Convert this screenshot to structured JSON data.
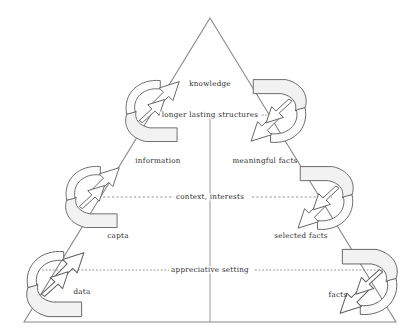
{
  "diagram": {
    "type": "hierarchy-triangle",
    "stroke_color": "#555555",
    "fill_color": "#f4f4f4",
    "text_color": "#2b2b2b",
    "apex": {
      "x": 210,
      "y": 18
    },
    "base_left": {
      "x": 24,
      "y": 322
    },
    "base_right": {
      "x": 396,
      "y": 322
    },
    "center_line_x": 210
  },
  "levels": [
    {
      "name": "knowledge",
      "label": "knowledge",
      "x": 210,
      "y": 84
    },
    {
      "name": "information",
      "label": "information",
      "x": 158,
      "y": 161
    },
    {
      "name": "meaningful-facts",
      "label": "meaningful facts",
      "x": 265,
      "y": 161
    },
    {
      "name": "capta",
      "label": "capta",
      "x": 118,
      "y": 236
    },
    {
      "name": "selected-facts",
      "label": "selected facts",
      "x": 301,
      "y": 236
    },
    {
      "name": "data",
      "label": "data",
      "x": 82,
      "y": 292
    },
    {
      "name": "facts",
      "label": "facts",
      "x": 338,
      "y": 295
    }
  ],
  "boundaries": [
    {
      "name": "longer-lasting-structures",
      "label": "longer lasting structures",
      "y": 115,
      "x": 210,
      "left_start": 158,
      "left_end": 176,
      "right_start": 262,
      "right_end": 281
    },
    {
      "name": "context-interests",
      "label": "context, interests",
      "y": 197,
      "x": 210,
      "left_start": 90,
      "left_end": 176,
      "right_start": 252,
      "right_end": 332
    },
    {
      "name": "appreciative-setting",
      "label": "appreciative setting",
      "y": 270,
      "x": 210,
      "left_start": 42,
      "left_end": 170,
      "right_start": 255,
      "right_end": 385
    }
  ],
  "arrows": [
    {
      "name": "arrow-left-lower",
      "side": "left",
      "direction": "up-right",
      "cx": 57,
      "cy": 283
    },
    {
      "name": "arrow-left-middle",
      "side": "left",
      "direction": "up-right",
      "cx": 94,
      "cy": 196
    },
    {
      "name": "arrow-left-upper",
      "side": "left",
      "direction": "up-right",
      "cx": 154,
      "cy": 110
    },
    {
      "name": "arrow-right-upper",
      "side": "right",
      "direction": "down-left",
      "cx": 277,
      "cy": 112
    },
    {
      "name": "arrow-right-middle",
      "side": "right",
      "direction": "down-left",
      "cx": 324,
      "cy": 199
    },
    {
      "name": "arrow-right-lower",
      "side": "right",
      "direction": "down-left",
      "cx": 367,
      "cy": 283
    }
  ]
}
